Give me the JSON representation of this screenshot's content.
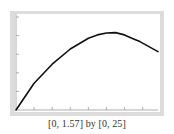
{
  "chart_data": {
    "type": "line",
    "title": "",
    "xlabel": "",
    "ylabel": "",
    "xlim": [
      0,
      1.57
    ],
    "ylim": [
      0,
      25
    ],
    "x_tick_step": 0.2,
    "y_tick_step": 5,
    "grid": false,
    "legend": null,
    "series": [
      {
        "name": "curve",
        "x": [
          0,
          0.2,
          0.4,
          0.6,
          0.8,
          0.9,
          1.0,
          1.1,
          1.2,
          1.3,
          1.37,
          1.45,
          1.57
        ],
        "y": [
          0,
          7.2,
          12.3,
          16.4,
          19.3,
          20.2,
          20.7,
          20.8,
          20.2,
          19.1,
          18.4,
          17.3,
          15.7
        ]
      }
    ],
    "caption": "[0, 1.57] by [0, 25]"
  },
  "colors": {
    "frame": "#dcdcdc",
    "curve": "#111111",
    "axis": "#9a9a9a"
  }
}
